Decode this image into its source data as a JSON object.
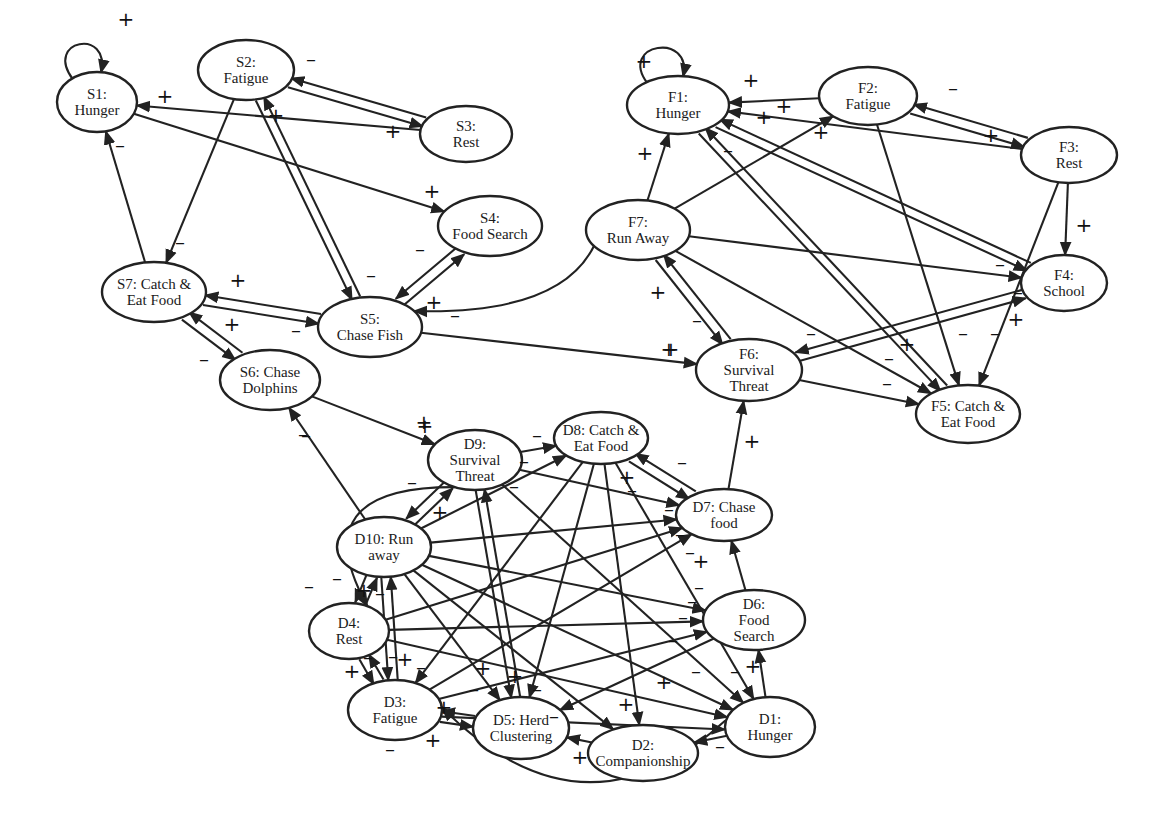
{
  "diagram": {
    "title": "",
    "colors": {
      "stroke": "#222222",
      "fill": "#ffffff",
      "text": "#1a1a1a"
    },
    "groups": [
      {
        "id": "shark",
        "prefix": "S"
      },
      {
        "id": "fish",
        "prefix": "F"
      },
      {
        "id": "dolphin",
        "prefix": "D"
      }
    ],
    "nodes": [
      {
        "id": "S1",
        "lines": [
          "S1:",
          "Hunger"
        ],
        "cx": 97,
        "cy": 102,
        "rx": 40,
        "ry": 30
      },
      {
        "id": "S2",
        "lines": [
          "S2:",
          "Fatigue"
        ],
        "cx": 246,
        "cy": 70,
        "rx": 48,
        "ry": 30
      },
      {
        "id": "S3",
        "lines": [
          "S3:",
          "Rest"
        ],
        "cx": 466,
        "cy": 134,
        "rx": 46,
        "ry": 28
      },
      {
        "id": "S4",
        "lines": [
          "S4:",
          "Food Search"
        ],
        "cx": 490,
        "cy": 226,
        "rx": 52,
        "ry": 30
      },
      {
        "id": "S5",
        "lines": [
          "S5:",
          "Chase Fish"
        ],
        "cx": 370,
        "cy": 327,
        "rx": 52,
        "ry": 30
      },
      {
        "id": "S6",
        "lines": [
          "S6:  Chase",
          "Dolphins"
        ],
        "cx": 270,
        "cy": 380,
        "rx": 50,
        "ry": 30
      },
      {
        "id": "S7",
        "lines": [
          "S7:  Catch &",
          "Eat Food"
        ],
        "cx": 154,
        "cy": 292,
        "rx": 52,
        "ry": 30
      },
      {
        "id": "F1",
        "lines": [
          "F1:",
          "Hunger"
        ],
        "cx": 678,
        "cy": 105,
        "rx": 51,
        "ry": 29
      },
      {
        "id": "F2",
        "lines": [
          "F2:",
          "Fatigue"
        ],
        "cx": 868,
        "cy": 96,
        "rx": 49,
        "ry": 29
      },
      {
        "id": "F3",
        "lines": [
          "F3:",
          "Rest"
        ],
        "cx": 1069,
        "cy": 155,
        "rx": 48,
        "ry": 28
      },
      {
        "id": "F4",
        "lines": [
          "F4:",
          "School"
        ],
        "cx": 1064,
        "cy": 283,
        "rx": 43,
        "ry": 28
      },
      {
        "id": "F5",
        "lines": [
          "F5:  Catch &",
          "Eat Food"
        ],
        "cx": 968,
        "cy": 414,
        "rx": 52,
        "ry": 29
      },
      {
        "id": "F6",
        "lines": [
          "F6:",
          "Survival",
          "Threat"
        ],
        "cx": 749,
        "cy": 370,
        "rx": 53,
        "ry": 31
      },
      {
        "id": "F7",
        "lines": [
          "F7:",
          "Run Away"
        ],
        "cx": 638,
        "cy": 230,
        "rx": 52,
        "ry": 30
      },
      {
        "id": "D1",
        "lines": [
          "D1:",
          "Hunger"
        ],
        "cx": 770,
        "cy": 727,
        "rx": 45,
        "ry": 30
      },
      {
        "id": "D2",
        "lines": [
          "D2:",
          "Companionship"
        ],
        "cx": 643,
        "cy": 753,
        "rx": 55,
        "ry": 28
      },
      {
        "id": "D3",
        "lines": [
          "D3:",
          "Fatigue"
        ],
        "cx": 395,
        "cy": 710,
        "rx": 47,
        "ry": 30
      },
      {
        "id": "D4",
        "lines": [
          "D4:",
          "Rest"
        ],
        "cx": 349,
        "cy": 631,
        "rx": 40,
        "ry": 28
      },
      {
        "id": "D5",
        "lines": [
          "D5:  Herd",
          "Clustering"
        ],
        "cx": 521,
        "cy": 728,
        "rx": 48,
        "ry": 31
      },
      {
        "id": "D6",
        "lines": [
          "D6:",
          "Food",
          "Search"
        ],
        "cx": 754,
        "cy": 620,
        "rx": 51,
        "ry": 30
      },
      {
        "id": "D7",
        "lines": [
          "D7:  Chase",
          "food"
        ],
        "cx": 724,
        "cy": 515,
        "rx": 48,
        "ry": 26
      },
      {
        "id": "D8",
        "lines": [
          "D8:  Catch &",
          "Eat Food"
        ],
        "cx": 601,
        "cy": 438,
        "rx": 47,
        "ry": 26
      },
      {
        "id": "D9",
        "lines": [
          "D9:",
          "Survival",
          "Threat"
        ],
        "cx": 475,
        "cy": 460,
        "rx": 47,
        "ry": 30
      },
      {
        "id": "D10",
        "lines": [
          "D10:  Run",
          "away"
        ],
        "cx": 384,
        "cy": 547,
        "rx": 47,
        "ry": 30
      }
    ],
    "edges": [
      {
        "from": "S1",
        "to": "S1",
        "sign": "+",
        "self": true
      },
      {
        "from": "S2",
        "to": "S3",
        "sign": "+"
      },
      {
        "from": "S3",
        "to": "S2",
        "sign": "-"
      },
      {
        "from": "S3",
        "to": "S1",
        "sign": "+"
      },
      {
        "from": "S1",
        "to": "S4",
        "sign": "+"
      },
      {
        "from": "S2",
        "to": "S7",
        "sign": "-"
      },
      {
        "from": "S2",
        "to": "S5",
        "sign": "-"
      },
      {
        "from": "S5",
        "to": "S2",
        "sign": "+"
      },
      {
        "from": "S7",
        "to": "S1",
        "sign": "-"
      },
      {
        "from": "S5",
        "to": "S4",
        "sign": "-"
      },
      {
        "from": "S4",
        "to": "S5",
        "sign": "+"
      },
      {
        "from": "S5",
        "to": "S7",
        "sign": "+"
      },
      {
        "from": "S7",
        "to": "S5",
        "sign": "-"
      },
      {
        "from": "S6",
        "to": "S7",
        "sign": "+"
      },
      {
        "from": "S7",
        "to": "S6",
        "sign": "-"
      },
      {
        "from": "F7",
        "to": "S5",
        "sign": "-"
      },
      {
        "from": "S5",
        "to": "F6",
        "sign": "+"
      },
      {
        "from": "S6",
        "to": "D9",
        "sign": "+"
      },
      {
        "from": "D10",
        "to": "S6",
        "sign": "-"
      },
      {
        "from": "F1",
        "to": "F1",
        "sign": "+",
        "self": true
      },
      {
        "from": "F2",
        "to": "F1",
        "sign": "+"
      },
      {
        "from": "F3",
        "to": "F1",
        "sign": "+"
      },
      {
        "from": "F2",
        "to": "F3",
        "sign": "+"
      },
      {
        "from": "F3",
        "to": "F2",
        "sign": "-"
      },
      {
        "from": "F7",
        "to": "F1",
        "sign": "+"
      },
      {
        "from": "F7",
        "to": "F2",
        "sign": "+"
      },
      {
        "from": "F4",
        "to": "F1",
        "sign": "+"
      },
      {
        "from": "F1",
        "to": "F4",
        "sign": "-"
      },
      {
        "from": "F5",
        "to": "F1",
        "sign": "-"
      },
      {
        "from": "F1",
        "to": "F5",
        "sign": "+"
      },
      {
        "from": "F2",
        "to": "F5",
        "sign": "-"
      },
      {
        "from": "F3",
        "to": "F4",
        "sign": "+"
      },
      {
        "from": "F3",
        "to": "F5",
        "sign": "-"
      },
      {
        "from": "F7",
        "to": "F4",
        "sign": "-"
      },
      {
        "from": "F7",
        "to": "F5",
        "sign": "-"
      },
      {
        "from": "F7",
        "to": "F6",
        "sign": "-"
      },
      {
        "from": "F6",
        "to": "F7",
        "sign": "+"
      },
      {
        "from": "F4",
        "to": "F6",
        "sign": "-"
      },
      {
        "from": "F6",
        "to": "F4",
        "sign": "+"
      },
      {
        "from": "F6",
        "to": "F5",
        "sign": "-"
      },
      {
        "from": "D7",
        "to": "F6",
        "sign": "+"
      },
      {
        "from": "D9",
        "to": "D8",
        "sign": "-"
      },
      {
        "from": "D10",
        "to": "D9",
        "sign": "-"
      },
      {
        "from": "D9",
        "to": "D10",
        "sign": "+"
      },
      {
        "from": "D9",
        "to": "D4",
        "sign": "-",
        "curve": true
      },
      {
        "from": "D9",
        "to": "D7",
        "sign": "-"
      },
      {
        "from": "D9",
        "to": "D5",
        "sign": "-"
      },
      {
        "from": "D5",
        "to": "D9",
        "sign": "-"
      },
      {
        "from": "D9",
        "to": "D1",
        "sign": "-"
      },
      {
        "from": "D8",
        "to": "D7",
        "sign": "-"
      },
      {
        "from": "D7",
        "to": "D8",
        "sign": "+"
      },
      {
        "from": "D8",
        "to": "D3",
        "sign": "+"
      },
      {
        "from": "D8",
        "to": "D5",
        "sign": "-"
      },
      {
        "from": "D8",
        "to": "D2",
        "sign": "+"
      },
      {
        "from": "D8",
        "to": "D1",
        "sign": "-"
      },
      {
        "from": "D10",
        "to": "D8",
        "sign": "-"
      },
      {
        "from": "D10",
        "to": "D7",
        "sign": "-"
      },
      {
        "from": "D10",
        "to": "D6",
        "sign": "-"
      },
      {
        "from": "D10",
        "to": "D1",
        "sign": "-"
      },
      {
        "from": "D10",
        "to": "D5",
        "sign": "+"
      },
      {
        "from": "D10",
        "to": "D2",
        "sign": "-"
      },
      {
        "from": "D10",
        "to": "D4",
        "sign": "+"
      },
      {
        "from": "D4",
        "to": "D10",
        "sign": "-"
      },
      {
        "from": "D10",
        "to": "D3",
        "sign": "+"
      },
      {
        "from": "D3",
        "to": "D10",
        "sign": "-"
      },
      {
        "from": "D4",
        "to": "D6",
        "sign": "-"
      },
      {
        "from": "D4",
        "to": "D7",
        "sign": "-"
      },
      {
        "from": "D4",
        "to": "D1",
        "sign": "+"
      },
      {
        "from": "D4",
        "to": "D3",
        "sign": "+"
      },
      {
        "from": "D3",
        "to": "D4",
        "sign": "-"
      },
      {
        "from": "D3",
        "to": "D7",
        "sign": "-"
      },
      {
        "from": "D3",
        "to": "D6",
        "sign": "-"
      },
      {
        "from": "D3",
        "to": "D1",
        "sign": "-"
      },
      {
        "from": "D3",
        "to": "D5",
        "sign": "+"
      },
      {
        "from": "D5",
        "to": "D3",
        "sign": "+"
      },
      {
        "from": "D6",
        "to": "D7",
        "sign": "+"
      },
      {
        "from": "D6",
        "to": "D5",
        "sign": "-"
      },
      {
        "from": "D1",
        "to": "D6",
        "sign": "+"
      },
      {
        "from": "D1",
        "to": "D2",
        "sign": "-"
      },
      {
        "from": "D2",
        "to": "D5",
        "sign": "+"
      },
      {
        "from": "D1",
        "to": "D3",
        "sign": "-",
        "curve": true
      }
    ],
    "sign_labels": [
      {
        "t": "+",
        "x": 126,
        "y": 20
      },
      {
        "t": "+",
        "x": 165,
        "y": 97
      },
      {
        "t": "-",
        "x": 120,
        "y": 146
      },
      {
        "t": "-",
        "x": 311,
        "y": 60
      },
      {
        "t": "+",
        "x": 393,
        "y": 132
      },
      {
        "t": "+",
        "x": 276,
        "y": 116
      },
      {
        "t": "+",
        "x": 432,
        "y": 192
      },
      {
        "t": "-",
        "x": 180,
        "y": 243
      },
      {
        "t": "-",
        "x": 371,
        "y": 276
      },
      {
        "t": "-",
        "x": 420,
        "y": 250
      },
      {
        "t": "+",
        "x": 434,
        "y": 303
      },
      {
        "t": "-",
        "x": 455,
        "y": 316
      },
      {
        "t": "+",
        "x": 238,
        "y": 281
      },
      {
        "t": "-",
        "x": 296,
        "y": 331
      },
      {
        "t": "+",
        "x": 232,
        "y": 325
      },
      {
        "t": "-",
        "x": 204,
        "y": 360
      },
      {
        "t": "+",
        "x": 669,
        "y": 350
      },
      {
        "t": "+",
        "x": 424,
        "y": 423
      },
      {
        "t": "-",
        "x": 303,
        "y": 435
      },
      {
        "t": "+",
        "x": 644,
        "y": 62
      },
      {
        "t": "+",
        "x": 751,
        "y": 81
      },
      {
        "t": "+",
        "x": 784,
        "y": 107
      },
      {
        "t": "+",
        "x": 764,
        "y": 118
      },
      {
        "t": "+",
        "x": 821,
        "y": 133
      },
      {
        "t": "-",
        "x": 953,
        "y": 89
      },
      {
        "t": "+",
        "x": 991,
        "y": 136
      },
      {
        "t": "+",
        "x": 645,
        "y": 154
      },
      {
        "t": "-",
        "x": 728,
        "y": 151
      },
      {
        "t": "+",
        "x": 1084,
        "y": 226
      },
      {
        "t": "-",
        "x": 1000,
        "y": 265
      },
      {
        "t": "-",
        "x": 1018,
        "y": 293
      },
      {
        "t": "+",
        "x": 1016,
        "y": 320
      },
      {
        "t": "+",
        "x": 658,
        "y": 293
      },
      {
        "t": "-",
        "x": 697,
        "y": 321
      },
      {
        "t": "+",
        "x": 671,
        "y": 350
      },
      {
        "t": "-",
        "x": 811,
        "y": 334
      },
      {
        "t": "+",
        "x": 907,
        "y": 345
      },
      {
        "t": "-",
        "x": 889,
        "y": 359
      },
      {
        "t": "-",
        "x": 887,
        "y": 384
      },
      {
        "t": "-",
        "x": 963,
        "y": 334
      },
      {
        "t": "-",
        "x": 995,
        "y": 334
      },
      {
        "t": "+",
        "x": 752,
        "y": 442
      },
      {
        "t": "+",
        "x": 425,
        "y": 427
      },
      {
        "t": "-",
        "x": 306,
        "y": 436
      },
      {
        "t": "-",
        "x": 537,
        "y": 436
      },
      {
        "t": "-",
        "x": 412,
        "y": 483
      },
      {
        "t": "+",
        "x": 440,
        "y": 513
      },
      {
        "t": "-",
        "x": 524,
        "y": 462
      },
      {
        "t": "-",
        "x": 514,
        "y": 487
      },
      {
        "t": "+",
        "x": 627,
        "y": 478
      },
      {
        "t": "-",
        "x": 632,
        "y": 491
      },
      {
        "t": "-",
        "x": 682,
        "y": 463
      },
      {
        "t": "-",
        "x": 669,
        "y": 510
      },
      {
        "t": "-",
        "x": 680,
        "y": 535
      },
      {
        "t": "-",
        "x": 690,
        "y": 553
      },
      {
        "t": "+",
        "x": 701,
        "y": 562
      },
      {
        "t": "-",
        "x": 699,
        "y": 588
      },
      {
        "t": "-",
        "x": 692,
        "y": 602
      },
      {
        "t": "-",
        "x": 683,
        "y": 618
      },
      {
        "t": "-",
        "x": 673,
        "y": 641
      },
      {
        "t": "-",
        "x": 696,
        "y": 672
      },
      {
        "t": "-",
        "x": 735,
        "y": 672
      },
      {
        "t": "+",
        "x": 664,
        "y": 683
      },
      {
        "t": "+",
        "x": 753,
        "y": 667
      },
      {
        "t": "-",
        "x": 309,
        "y": 587
      },
      {
        "t": "-",
        "x": 337,
        "y": 579
      },
      {
        "t": "+",
        "x": 364,
        "y": 591
      },
      {
        "t": "-",
        "x": 380,
        "y": 594
      },
      {
        "t": "+",
        "x": 352,
        "y": 672
      },
      {
        "t": "-",
        "x": 368,
        "y": 658
      },
      {
        "t": "-",
        "x": 393,
        "y": 657
      },
      {
        "t": "+",
        "x": 405,
        "y": 660
      },
      {
        "t": "-",
        "x": 421,
        "y": 668
      },
      {
        "t": "+",
        "x": 483,
        "y": 669
      },
      {
        "t": "-",
        "x": 474,
        "y": 690
      },
      {
        "t": "+",
        "x": 515,
        "y": 677
      },
      {
        "t": "-",
        "x": 537,
        "y": 690
      },
      {
        "t": "+",
        "x": 444,
        "y": 708
      },
      {
        "t": "+",
        "x": 433,
        "y": 741
      },
      {
        "t": "-",
        "x": 390,
        "y": 750
      },
      {
        "t": "-",
        "x": 554,
        "y": 717
      },
      {
        "t": "+",
        "x": 580,
        "y": 758
      },
      {
        "t": "+",
        "x": 626,
        "y": 705
      },
      {
        "t": "-",
        "x": 720,
        "y": 747
      }
    ]
  }
}
